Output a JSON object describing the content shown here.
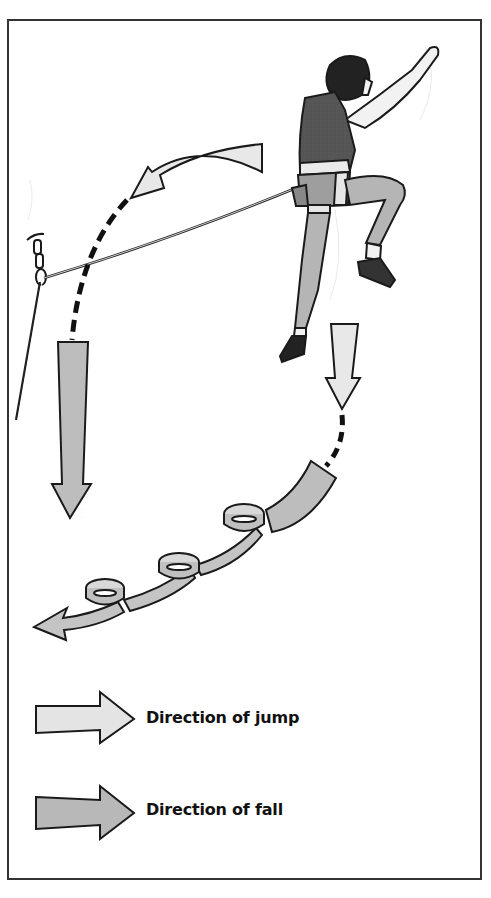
{
  "figure": {
    "colors": {
      "jump_arrow_fill": "#e6e6e6",
      "fall_arrow_fill": "#b8b8b8",
      "outline": "#1a1a1a",
      "frame": "#333333"
    }
  },
  "legend": {
    "items": [
      {
        "label": "Direction of jump",
        "arrow": "light-arrow"
      },
      {
        "label": "Direction of fall",
        "arrow": "dark-arrow"
      }
    ]
  }
}
